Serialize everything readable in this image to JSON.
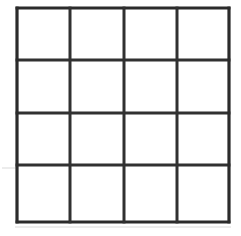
{
  "figure": {
    "name": "four-by-four-grid",
    "background_color": "#ffffff",
    "line_color": "#313131",
    "outer_line_color": "#2b2b2b",
    "artifact_color": "#d9d9d9",
    "line_width_px": 3,
    "rows": 4,
    "columns": 4,
    "cell_count": 16,
    "canvas": {
      "width": 241,
      "height": 236
    }
  },
  "geometry": {
    "vertical_line_x": [
      17,
      70,
      124,
      177,
      229
    ],
    "horizontal_line_y": [
      8,
      60,
      113,
      165,
      222
    ],
    "bounds": {
      "left": 17,
      "top": 8,
      "right": 229,
      "bottom": 222
    }
  },
  "artifacts": [
    {
      "name": "faint-left-extension",
      "x1": 2,
      "y1": 168,
      "x2": 17,
      "y2": 168
    },
    {
      "name": "faint-bottom-extension",
      "x1": 15,
      "y1": 227,
      "x2": 231,
      "y2": 227
    }
  ],
  "cells": [
    {
      "id": "r1c1",
      "row": 1,
      "col": 1,
      "label": ""
    },
    {
      "id": "r1c2",
      "row": 1,
      "col": 2,
      "label": ""
    },
    {
      "id": "r1c3",
      "row": 1,
      "col": 3,
      "label": ""
    },
    {
      "id": "r1c4",
      "row": 1,
      "col": 4,
      "label": ""
    },
    {
      "id": "r2c1",
      "row": 2,
      "col": 1,
      "label": ""
    },
    {
      "id": "r2c2",
      "row": 2,
      "col": 2,
      "label": ""
    },
    {
      "id": "r2c3",
      "row": 2,
      "col": 3,
      "label": ""
    },
    {
      "id": "r2c4",
      "row": 2,
      "col": 4,
      "label": ""
    },
    {
      "id": "r3c1",
      "row": 3,
      "col": 1,
      "label": ""
    },
    {
      "id": "r3c2",
      "row": 3,
      "col": 2,
      "label": ""
    },
    {
      "id": "r3c3",
      "row": 3,
      "col": 3,
      "label": ""
    },
    {
      "id": "r3c4",
      "row": 3,
      "col": 4,
      "label": ""
    },
    {
      "id": "r4c1",
      "row": 4,
      "col": 1,
      "label": ""
    },
    {
      "id": "r4c2",
      "row": 4,
      "col": 2,
      "label": ""
    },
    {
      "id": "r4c3",
      "row": 4,
      "col": 3,
      "label": ""
    },
    {
      "id": "r4c4",
      "row": 4,
      "col": 4,
      "label": ""
    }
  ]
}
